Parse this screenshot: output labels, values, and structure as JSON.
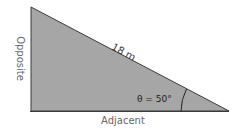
{
  "diagram": {
    "type": "right-triangle",
    "hypotenuse_label": "18 m",
    "opposite_label": "Opposite",
    "adjacent_label": "Adjacent",
    "angle_label": "θ = 50°",
    "fill_color": "#a6a6a6",
    "stroke_color": "#3a3a3a"
  }
}
